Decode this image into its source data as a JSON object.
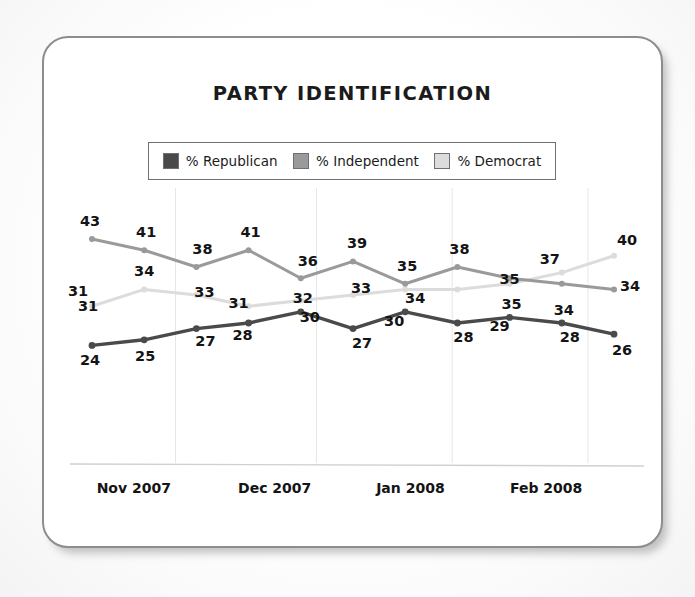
{
  "card": {
    "title": "PARTY IDENTIFICATION"
  },
  "legend": {
    "items": [
      {
        "label": "% Republican",
        "color": "#4a4a4a",
        "key": "republican"
      },
      {
        "label": "% Independent",
        "color": "#9a9a9a",
        "key": "independent"
      },
      {
        "label": "% Democrat",
        "color": "#dcdcdc",
        "key": "democrat"
      }
    ]
  },
  "chart_data": {
    "type": "line",
    "title": "PARTY IDENTIFICATION",
    "xlabel": "",
    "ylabel": "",
    "grid": true,
    "legend_position": "top",
    "ylim": [
      20,
      46
    ],
    "x_tick_labels": [
      "Nov 2007",
      "Dec 2007",
      "Jan 2008",
      "Feb 2008"
    ],
    "x_tick_positions": [
      0.8,
      3.5,
      6.1,
      8.7
    ],
    "gridline_positions": [
      1.6,
      4.3,
      6.9,
      9.5
    ],
    "n_points": 11,
    "series": [
      {
        "name": "% Republican",
        "color": "#4a4a4a",
        "values": [
          24,
          25,
          27,
          28,
          30,
          27,
          30,
          28,
          29,
          28,
          26
        ],
        "label_positions": [
          "above",
          "below",
          "below",
          "below",
          "below",
          "below",
          "below",
          "below",
          "below",
          "below",
          "below"
        ],
        "extra_label": {
          "value": 31,
          "position": "above-first"
        }
      },
      {
        "name": "% Independent",
        "color": "#9a9a9a",
        "values": [
          43,
          41,
          38,
          41,
          36,
          39,
          35,
          38,
          36,
          35,
          34
        ],
        "labels_shown": [
          43,
          41,
          38,
          41,
          36,
          39,
          35,
          38,
          null,
          null,
          34
        ]
      },
      {
        "name": "% Democrat",
        "color": "#dcdcdc",
        "values": [
          31,
          34,
          33,
          31,
          32,
          33,
          34,
          34,
          35,
          37,
          40
        ],
        "labels_shown": [
          null,
          34,
          33,
          31,
          32,
          33,
          null,
          null,
          null,
          37,
          40
        ]
      }
    ],
    "point_labels": {
      "republican": [
        "24",
        "25",
        "27",
        "28",
        "30",
        "27",
        "30",
        "28",
        "29",
        "28",
        "26"
      ],
      "independent": [
        "43",
        "41",
        "38",
        "41",
        "36",
        "39",
        "35",
        "38",
        "",
        "",
        "34"
      ],
      "democrat": [
        "31",
        "34",
        "33",
        "31",
        "32",
        "33",
        "",
        "",
        "35",
        "37",
        "40"
      ]
    }
  },
  "axis": {
    "months": [
      {
        "label": "Nov 2007"
      },
      {
        "label": "Dec 2007"
      },
      {
        "label": "Jan 2008"
      },
      {
        "label": "Feb 2008"
      }
    ]
  }
}
